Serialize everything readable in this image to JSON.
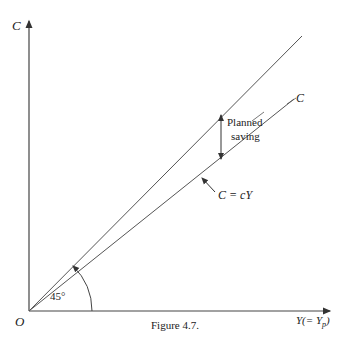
{
  "figure": {
    "caption": "Figure 4.7.",
    "y_axis_label": "C",
    "x_axis_label": "Y(= Y",
    "x_axis_subscript": "p",
    "x_axis_close": ")",
    "origin_label": "O",
    "angle_label": "45°",
    "line_45_label": "",
    "consumption_line_label": "C",
    "consumption_eq_label": "C = cY",
    "gap_label_line1": "Planned",
    "gap_label_line2": "saving"
  },
  "colors": {
    "ink": "#333333",
    "background": "#ffffff"
  }
}
